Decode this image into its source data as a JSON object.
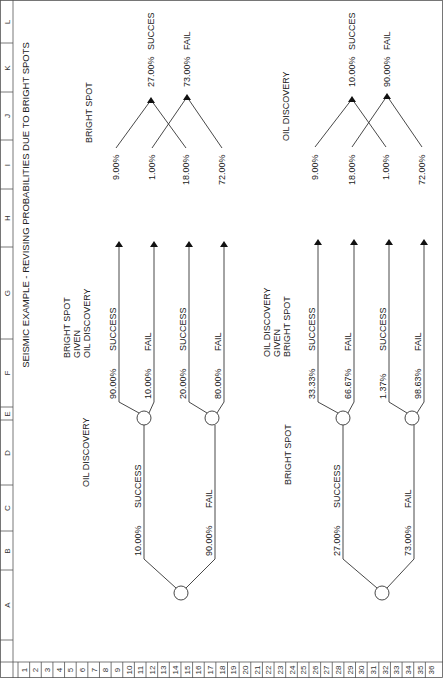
{
  "title": "SEISMIC EXAMPLE - REVISING PROBABILITIES DUE TO BRIGHT SPOTS",
  "column_headers": [
    "A",
    "B",
    "C",
    "D",
    "E",
    "F",
    "G",
    "H",
    "I",
    "J",
    "K",
    "L"
  ],
  "row_headers": [
    "1",
    "2",
    "3",
    "4",
    "5",
    "6",
    "7",
    "8",
    "9",
    "10",
    "11",
    "12",
    "13",
    "14",
    "15",
    "16",
    "17",
    "18",
    "19",
    "20",
    "21",
    "22",
    "23",
    "24",
    "25",
    "26",
    "27",
    "28",
    "29",
    "30",
    "31",
    "32",
    "33",
    "34",
    "35",
    "36"
  ],
  "tree1": {
    "root_label": "OIL DISCOVERY",
    "branches": [
      {
        "prob": "10.00%",
        "label": "SUCCESS"
      },
      {
        "prob": "90.00%",
        "label": "FAIL"
      }
    ],
    "second_label": [
      "BRIGHT SPOT",
      "GIVEN",
      "OIL DISCOVERY"
    ],
    "leaves": [
      {
        "prob": "90.00%",
        "label": "SUCCESS"
      },
      {
        "prob": "10.00%",
        "label": "FAIL"
      },
      {
        "prob": "20.00%",
        "label": "SUCCESS"
      },
      {
        "prob": "80.00%",
        "label": "FAIL"
      }
    ],
    "joint_label": "BRIGHT SPOT",
    "joint": [
      "9.00%",
      "1.00%",
      "18.00%",
      "72.00%"
    ],
    "marginals": [
      {
        "prob": "27.00%",
        "label": "SUCCES"
      },
      {
        "prob": "73.00%",
        "label": "FAIL"
      }
    ]
  },
  "tree2": {
    "root_label": "BRIGHT SPOT",
    "branches": [
      {
        "prob": "27.00%",
        "label": "SUCCESS"
      },
      {
        "prob": "73.00%",
        "label": "FAIL"
      }
    ],
    "second_label": [
      "OIL DISCOVERY",
      "GIVEN",
      "BRIGHT SPOT"
    ],
    "leaves": [
      {
        "prob": "33.33%",
        "label": "SUCCESS"
      },
      {
        "prob": "66.67%",
        "label": "FAIL"
      },
      {
        "prob": "1.37%",
        "label": "SUCCESS"
      },
      {
        "prob": "98.63%",
        "label": "FAIL"
      }
    ],
    "joint_label": "OIL DISCOVERY",
    "joint": [
      "9.00%",
      "18.00%",
      "1.00%",
      "72.00%"
    ],
    "marginals": [
      {
        "prob": "10.00%",
        "label": "SUCCES"
      },
      {
        "prob": "90.00%",
        "label": "FAIL"
      }
    ]
  }
}
